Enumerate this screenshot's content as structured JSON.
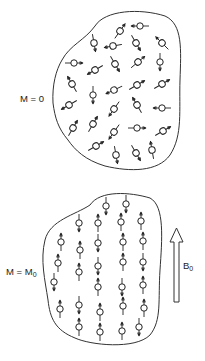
{
  "figure": {
    "top_panel": {
      "label_main": "M = 0",
      "description": "randomly oriented nuclear spins, no net magnetization",
      "spins": [
        {
          "x": 120,
          "y": 31,
          "a": 35
        },
        {
          "x": 140,
          "y": 26,
          "a": -90
        },
        {
          "x": 94,
          "y": 43,
          "a": 170
        },
        {
          "x": 113,
          "y": 46,
          "a": -100
        },
        {
          "x": 136,
          "y": 43,
          "a": 150
        },
        {
          "x": 162,
          "y": 43,
          "a": -45
        },
        {
          "x": 74,
          "y": 63,
          "a": 90
        },
        {
          "x": 95,
          "y": 70,
          "a": -120
        },
        {
          "x": 115,
          "y": 64,
          "a": 150
        },
        {
          "x": 138,
          "y": 62,
          "a": 50
        },
        {
          "x": 160,
          "y": 62,
          "a": 180
        },
        {
          "x": 72,
          "y": 84,
          "a": -30
        },
        {
          "x": 93,
          "y": 95,
          "a": 180
        },
        {
          "x": 114,
          "y": 90,
          "a": -115
        },
        {
          "x": 137,
          "y": 85,
          "a": 60
        },
        {
          "x": 162,
          "y": 84,
          "a": 60
        },
        {
          "x": 69,
          "y": 105,
          "a": -120
        },
        {
          "x": 114,
          "y": 109,
          "a": -145
        },
        {
          "x": 137,
          "y": 105,
          "a": -30
        },
        {
          "x": 162,
          "y": 108,
          "a": -90
        },
        {
          "x": 73,
          "y": 128,
          "a": 30
        },
        {
          "x": 93,
          "y": 124,
          "a": 30
        },
        {
          "x": 114,
          "y": 132,
          "a": -145
        },
        {
          "x": 137,
          "y": 128,
          "a": 90
        },
        {
          "x": 163,
          "y": 131,
          "a": 60
        },
        {
          "x": 96,
          "y": 146,
          "a": 60
        },
        {
          "x": 116,
          "y": 155,
          "a": 170
        },
        {
          "x": 136,
          "y": 153,
          "a": 150
        },
        {
          "x": 152,
          "y": 150,
          "a": -10
        }
      ]
    },
    "bottom_panel": {
      "label_main": "M = M",
      "label_sub": "0",
      "description": "spins aligned parallel/antiparallel to field",
      "spins": [
        {
          "x": 106,
          "y": 206,
          "a": 180
        },
        {
          "x": 126,
          "y": 204,
          "a": 180
        },
        {
          "x": 79,
          "y": 223,
          "a": 180
        },
        {
          "x": 98,
          "y": 223,
          "a": 0
        },
        {
          "x": 121,
          "y": 222,
          "a": 0
        },
        {
          "x": 141,
          "y": 221,
          "a": 0
        },
        {
          "x": 61,
          "y": 242,
          "a": 0
        },
        {
          "x": 80,
          "y": 250,
          "a": 0
        },
        {
          "x": 98,
          "y": 243,
          "a": 180
        },
        {
          "x": 123,
          "y": 242,
          "a": 0
        },
        {
          "x": 143,
          "y": 241,
          "a": 0
        },
        {
          "x": 58,
          "y": 263,
          "a": 0
        },
        {
          "x": 79,
          "y": 272,
          "a": 0
        },
        {
          "x": 98,
          "y": 266,
          "a": 180
        },
        {
          "x": 123,
          "y": 262,
          "a": 0
        },
        {
          "x": 143,
          "y": 262,
          "a": 180
        },
        {
          "x": 54,
          "y": 282,
          "a": 180
        },
        {
          "x": 98,
          "y": 287,
          "a": 0
        },
        {
          "x": 122,
          "y": 287,
          "a": 180
        },
        {
          "x": 143,
          "y": 285,
          "a": 0
        },
        {
          "x": 60,
          "y": 309,
          "a": 0
        },
        {
          "x": 79,
          "y": 305,
          "a": 180
        },
        {
          "x": 100,
          "y": 312,
          "a": 0
        },
        {
          "x": 123,
          "y": 306,
          "a": 0
        },
        {
          "x": 144,
          "y": 308,
          "a": 0
        },
        {
          "x": 79,
          "y": 327,
          "a": 0
        },
        {
          "x": 100,
          "y": 332,
          "a": 0
        },
        {
          "x": 122,
          "y": 331,
          "a": 0
        },
        {
          "x": 139,
          "y": 327,
          "a": 180
        }
      ]
    },
    "field_arrow": {
      "label_main": "B",
      "label_sub": "0"
    }
  }
}
